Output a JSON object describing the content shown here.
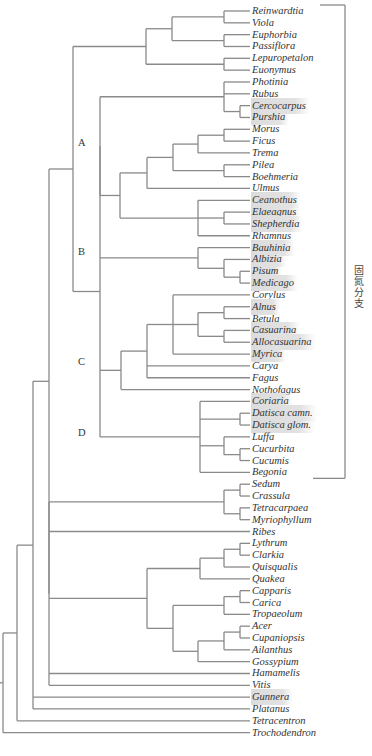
{
  "figure": {
    "type": "phylogenetic-tree",
    "bracket_label": "固氮分支",
    "line_color": "#8a8a8a",
    "highlight_color": "#dcdcdc",
    "clade_labels": [
      {
        "id": "A",
        "label": "A"
      },
      {
        "id": "B",
        "label": "B"
      },
      {
        "id": "C",
        "label": "C"
      },
      {
        "id": "D",
        "label": "D"
      }
    ],
    "taxa": [
      {
        "name": "Reinwardtia",
        "highlight": false
      },
      {
        "name": "Viola",
        "highlight": false
      },
      {
        "name": "Euphorbia",
        "highlight": false
      },
      {
        "name": "Passiflora",
        "highlight": false
      },
      {
        "name": "Lepuropetalon",
        "highlight": false
      },
      {
        "name": "Euonymus",
        "highlight": false
      },
      {
        "name": "Photinia",
        "highlight": false
      },
      {
        "name": "Rubus",
        "highlight": false
      },
      {
        "name": "Cercocarpus",
        "highlight": true
      },
      {
        "name": "Purshia",
        "highlight": true
      },
      {
        "name": "Morus",
        "highlight": false
      },
      {
        "name": "Ficus",
        "highlight": false
      },
      {
        "name": "Trema",
        "highlight": false
      },
      {
        "name": "Pilea",
        "highlight": false
      },
      {
        "name": "Boehmeria",
        "highlight": false
      },
      {
        "name": "Ulmus",
        "highlight": false
      },
      {
        "name": "Ceanothus",
        "highlight": true
      },
      {
        "name": "Elaeagnus",
        "highlight": true
      },
      {
        "name": "Shepherdia",
        "highlight": true
      },
      {
        "name": "Rhamnus",
        "highlight": false
      },
      {
        "name": "Bauhinia",
        "highlight": true
      },
      {
        "name": "Albizia",
        "highlight": true
      },
      {
        "name": "Pisum",
        "highlight": true
      },
      {
        "name": "Medicago",
        "highlight": true
      },
      {
        "name": "Corylus",
        "highlight": false
      },
      {
        "name": "Alnus",
        "highlight": true
      },
      {
        "name": "Betula",
        "highlight": false
      },
      {
        "name": "Casuarina",
        "highlight": true
      },
      {
        "name": "Allocasuarina",
        "highlight": true
      },
      {
        "name": "Myrica",
        "highlight": true
      },
      {
        "name": "Carya",
        "highlight": false
      },
      {
        "name": "Fagus",
        "highlight": false
      },
      {
        "name": "Nothofagus",
        "highlight": false
      },
      {
        "name": "Coriaria",
        "highlight": true
      },
      {
        "name": "Datisca camn.",
        "highlight": true
      },
      {
        "name": "Datisca glom.",
        "highlight": true
      },
      {
        "name": "Luffa",
        "highlight": false
      },
      {
        "name": "Cucurbita",
        "highlight": false
      },
      {
        "name": "Cucumis",
        "highlight": false
      },
      {
        "name": "Begonia",
        "highlight": false
      },
      {
        "name": "Sedum",
        "highlight": false
      },
      {
        "name": "Crassula",
        "highlight": false
      },
      {
        "name": "Tetracarpaea",
        "highlight": false
      },
      {
        "name": "Myriophyllum",
        "highlight": false
      },
      {
        "name": "Ribes",
        "highlight": false
      },
      {
        "name": "Lythrum",
        "highlight": false
      },
      {
        "name": "Clarkia",
        "highlight": false
      },
      {
        "name": "Quisqualis",
        "highlight": false
      },
      {
        "name": "Quakea",
        "highlight": false
      },
      {
        "name": "Capparis",
        "highlight": false
      },
      {
        "name": "Carica",
        "highlight": false
      },
      {
        "name": "Tropaeolum",
        "highlight": false
      },
      {
        "name": "Acer",
        "highlight": false
      },
      {
        "name": "Cupaniopsis",
        "highlight": false
      },
      {
        "name": "Ailanthus",
        "highlight": false
      },
      {
        "name": "Gossypium",
        "highlight": false
      },
      {
        "name": "Hamamelis",
        "highlight": false
      },
      {
        "name": "Vitis",
        "highlight": false
      },
      {
        "name": "Gunnera",
        "highlight": true
      },
      {
        "name": "Platanus",
        "highlight": false
      },
      {
        "name": "Tetracentron",
        "highlight": false
      },
      {
        "name": "Trochodendron",
        "highlight": false
      }
    ]
  }
}
